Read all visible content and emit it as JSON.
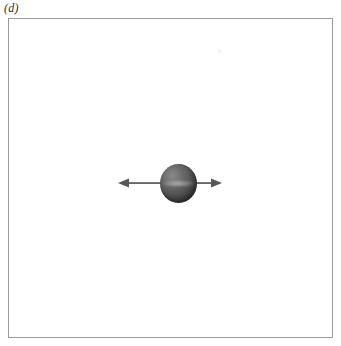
{
  "figure": {
    "panel_label": "(d)",
    "caption_position": "top-left",
    "background_color": "#ffffff",
    "frame": {
      "border_color": "#9a9a9a",
      "border_width_px": 1,
      "fill_color": "#ffffff"
    },
    "elements": {
      "sphere": {
        "name": "particle",
        "shape": "sphere",
        "diameter_px": 37,
        "center_x_px": 178,
        "center_y_px": 183,
        "shading": "radial-gradient",
        "highlight_color": "#8a8a8a",
        "body_color": "#565656",
        "shadow_color": "#343434",
        "highlight_position": "upper-left"
      },
      "arrow": {
        "name": "oscillation-arrow",
        "type": "double-headed",
        "orientation": "horizontal",
        "color": "#575757",
        "x_start_px": 118,
        "x_end_px": 222,
        "y_px": 183,
        "length_px": 104,
        "line_width_px": 1.6,
        "head_length_px": 11,
        "head_half_width_px": 4.5
      },
      "artifact": {
        "name": "scan-speck",
        "color": "#f4f1f1",
        "x_px": 210,
        "y_px": 32
      }
    }
  }
}
